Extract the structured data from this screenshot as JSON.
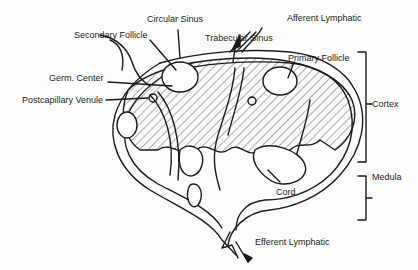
{
  "diagram": {
    "labels": {
      "circular_sinus": "Circular Sinus",
      "afferent_lymphatic": "Afferent Lymphatic",
      "secondary_follicle": "Secondary Follicle",
      "trabecular_sinus": "Trabecular Sinus",
      "primary_follicle": "Primary Follicle",
      "germ_center": "Germ. Center",
      "postcapillary_venule": "Postcapillary Venule",
      "cortex": "Cortex",
      "medula": "Medula",
      "cord": "Cord",
      "efferent_lymphatic": "Efferent Lymphatic"
    },
    "colors": {
      "line": "#1a1a1a",
      "background": "#fefefe"
    }
  }
}
